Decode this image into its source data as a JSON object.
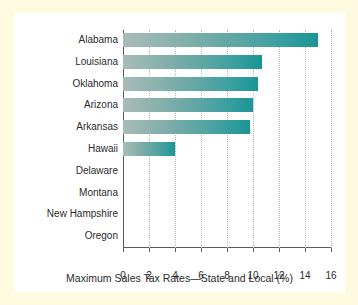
{
  "figure": {
    "border_color": "#fdfae0",
    "background_color": "#ffffff",
    "bar_gradient_start": "#a8bcb8",
    "bar_gradient_end": "#1a9596",
    "axis_color": "#5a5a5a",
    "gridline_color": "#b9b9b9"
  },
  "chart_data": {
    "type": "bar",
    "orientation": "horizontal",
    "title": "",
    "subtitle": "",
    "xlabel": "Maximum Sales Tax Rates—State and Local (%)",
    "ylabel": "",
    "categories": [
      "Alabama",
      "Louisiana",
      "Oklahoma",
      "Arizona",
      "Arkansas",
      "Hawaii",
      "Delaware",
      "Montana",
      "New Hampshire",
      "Oregon"
    ],
    "values": [
      15.0,
      10.7,
      10.4,
      10.0,
      9.75,
      4.0,
      0,
      0,
      0,
      0
    ],
    "xlim": [
      0,
      16
    ],
    "xticks": [
      0,
      2,
      4,
      6,
      8,
      10,
      12,
      14,
      16
    ],
    "xtick_labels": [
      "0",
      "2",
      "4",
      "6",
      "8",
      "10",
      "12",
      "14",
      "16"
    ],
    "grid": "vertical-dotted",
    "legend": "none",
    "annotations": []
  }
}
